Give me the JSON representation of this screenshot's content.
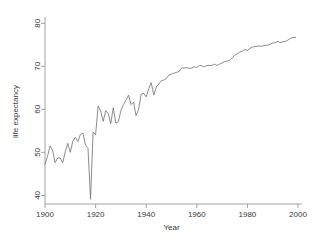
{
  "chart_data": {
    "type": "line",
    "title": "",
    "xlabel": "Year",
    "ylabel": "life expectancy",
    "xlim": [
      1900,
      2000
    ],
    "ylim": [
      38,
      81
    ],
    "grid": false,
    "legend": null,
    "xticks": [
      1900,
      1920,
      1940,
      1960,
      1980,
      2000
    ],
    "yticks": [
      40,
      50,
      60,
      70,
      80
    ],
    "xtick_labels": [
      "1900",
      "1920",
      "1940",
      "1960",
      "1980",
      "2000"
    ],
    "ytick_labels": [
      "40",
      "50",
      "60",
      "70",
      "80"
    ],
    "line_color": "#6e6e6e",
    "axis_color": "#8a8a8a",
    "text_color": "#3a3a3a",
    "background_color": "#ffffff",
    "series": [
      {
        "name": "life expectancy",
        "x": [
          1900,
          1901,
          1902,
          1903,
          1904,
          1905,
          1906,
          1907,
          1908,
          1909,
          1910,
          1911,
          1912,
          1913,
          1914,
          1915,
          1916,
          1917,
          1918,
          1919,
          1920,
          1921,
          1922,
          1923,
          1924,
          1925,
          1926,
          1927,
          1928,
          1929,
          1930,
          1931,
          1932,
          1933,
          1934,
          1935,
          1936,
          1937,
          1938,
          1939,
          1940,
          1941,
          1942,
          1943,
          1944,
          1945,
          1946,
          1947,
          1948,
          1949,
          1950,
          1951,
          1952,
          1953,
          1954,
          1955,
          1956,
          1957,
          1958,
          1959,
          1960,
          1961,
          1962,
          1963,
          1964,
          1965,
          1966,
          1967,
          1968,
          1969,
          1970,
          1971,
          1972,
          1973,
          1974,
          1975,
          1976,
          1977,
          1978,
          1979,
          1980,
          1981,
          1982,
          1983,
          1984,
          1985,
          1986,
          1987,
          1988,
          1989,
          1990,
          1991,
          1992,
          1993,
          1994,
          1995,
          1996,
          1997,
          1998,
          1999
        ],
        "values": [
          47.3,
          49.1,
          51.5,
          50.5,
          47.6,
          48.7,
          48.7,
          47.6,
          50.1,
          52.1,
          50.0,
          52.6,
          53.5,
          52.5,
          54.2,
          54.5,
          51.7,
          50.9,
          39.1,
          54.7,
          54.1,
          60.8,
          59.6,
          57.2,
          59.7,
          59.0,
          56.7,
          60.4,
          56.8,
          57.1,
          59.7,
          61.1,
          62.1,
          63.3,
          61.1,
          61.7,
          58.5,
          60.0,
          63.5,
          63.7,
          62.9,
          64.8,
          66.2,
          63.3,
          65.2,
          65.9,
          66.7,
          66.8,
          67.2,
          68.0,
          68.2,
          68.4,
          68.6,
          68.8,
          69.6,
          69.6,
          69.7,
          69.5,
          69.6,
          69.9,
          69.7,
          70.2,
          70.1,
          69.9,
          70.2,
          70.2,
          70.2,
          70.5,
          70.2,
          70.5,
          70.8,
          71.1,
          71.2,
          71.4,
          72.0,
          72.6,
          72.9,
          73.3,
          73.5,
          73.9,
          73.7,
          74.2,
          74.5,
          74.6,
          74.7,
          74.7,
          74.7,
          74.9,
          74.9,
          75.1,
          75.4,
          75.5,
          75.8,
          75.5,
          75.7,
          75.8,
          76.1,
          76.5,
          76.7,
          76.7
        ]
      }
    ]
  },
  "axes": {
    "x_title": "Year",
    "y_title": "life expectancy"
  }
}
